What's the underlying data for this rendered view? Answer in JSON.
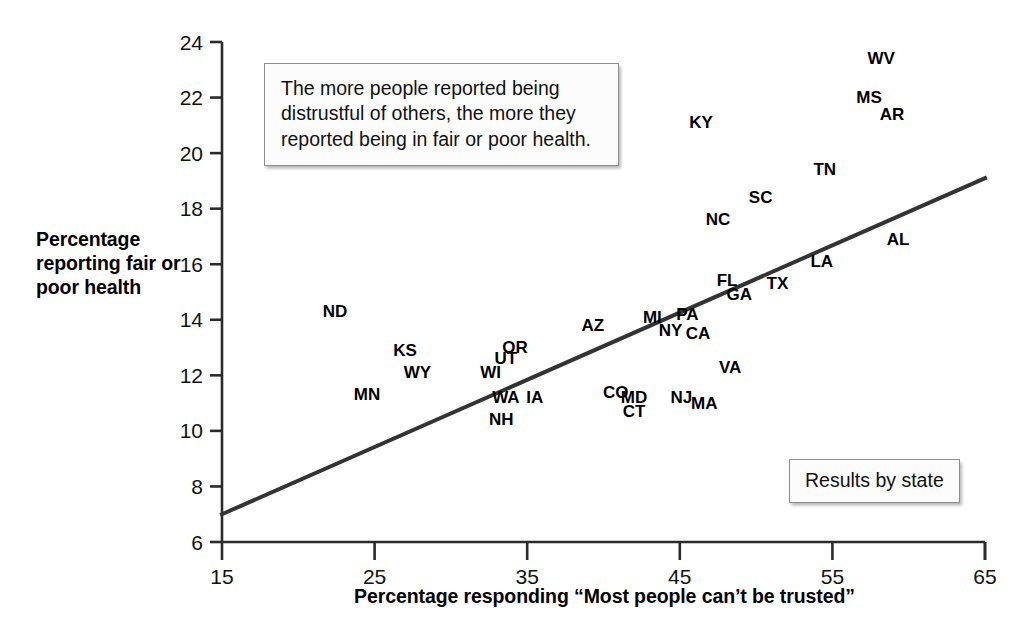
{
  "chart_data": {
    "type": "scatter",
    "title": "",
    "xlabel": "Percentage responding “Most people can’t be trusted”",
    "ylabel": "Percentage reporting fair or poor health",
    "xlim": [
      15,
      65
    ],
    "ylim": [
      6,
      24
    ],
    "xticks": [
      15,
      25,
      35,
      45,
      55,
      65
    ],
    "yticks": [
      6,
      8,
      10,
      12,
      14,
      16,
      18,
      20,
      22,
      24
    ],
    "grid": false,
    "legend_position": "bottom-right",
    "point_style": "text-label-only",
    "annotations": [
      {
        "name": "annotation-box",
        "text": "The more people reported being distrustful of others, the more they reported being in fair or poor health."
      },
      {
        "name": "legend-box",
        "text": "Results by state"
      }
    ],
    "trendline": {
      "name": "regression-line",
      "x": [
        15,
        65
      ],
      "y": [
        7.0,
        19.1
      ],
      "color": "#333333",
      "width": 4
    },
    "points": [
      {
        "label": "ND",
        "x": 22.4,
        "y": 14.1
      },
      {
        "label": "MN",
        "x": 24.5,
        "y": 11.1
      },
      {
        "label": "KS",
        "x": 27.0,
        "y": 12.7
      },
      {
        "label": "WY",
        "x": 27.8,
        "y": 11.9
      },
      {
        "label": "WI",
        "x": 32.6,
        "y": 11.9
      },
      {
        "label": "UT",
        "x": 33.6,
        "y": 12.4
      },
      {
        "label": "OR",
        "x": 34.2,
        "y": 12.8
      },
      {
        "label": "WA",
        "x": 33.6,
        "y": 11.0
      },
      {
        "label": "IA",
        "x": 35.5,
        "y": 11.0
      },
      {
        "label": "NH",
        "x": 33.3,
        "y": 10.2
      },
      {
        "label": "AZ",
        "x": 39.3,
        "y": 13.6
      },
      {
        "label": "CO",
        "x": 40.8,
        "y": 11.2
      },
      {
        "label": "MD",
        "x": 42.0,
        "y": 11.0
      },
      {
        "label": "CT",
        "x": 42.0,
        "y": 10.5
      },
      {
        "label": "MI",
        "x": 43.2,
        "y": 13.9
      },
      {
        "label": "NY",
        "x": 44.4,
        "y": 13.4
      },
      {
        "label": "PA",
        "x": 45.5,
        "y": 14.0
      },
      {
        "label": "CA",
        "x": 46.2,
        "y": 13.3
      },
      {
        "label": "NJ",
        "x": 45.1,
        "y": 11.0
      },
      {
        "label": "MA",
        "x": 46.6,
        "y": 10.8
      },
      {
        "label": "VA",
        "x": 48.3,
        "y": 12.1
      },
      {
        "label": "FL",
        "x": 48.1,
        "y": 15.2
      },
      {
        "label": "GA",
        "x": 48.9,
        "y": 14.7
      },
      {
        "label": "TX",
        "x": 51.4,
        "y": 15.1
      },
      {
        "label": "NC",
        "x": 47.5,
        "y": 17.4
      },
      {
        "label": "SC",
        "x": 50.3,
        "y": 18.2
      },
      {
        "label": "KY",
        "x": 46.4,
        "y": 20.9
      },
      {
        "label": "TN",
        "x": 54.5,
        "y": 19.2
      },
      {
        "label": "LA",
        "x": 54.3,
        "y": 15.9
      },
      {
        "label": "AL",
        "x": 59.3,
        "y": 16.7
      },
      {
        "label": "MS",
        "x": 57.4,
        "y": 21.8
      },
      {
        "label": "AR",
        "x": 58.9,
        "y": 21.2
      },
      {
        "label": "WV",
        "x": 58.2,
        "y": 23.2
      }
    ]
  },
  "axes": {
    "y_title": "Percentage reporting fair or poor health",
    "x_title": "Percentage responding “Most people can’t be trusted”"
  },
  "boxes": {
    "annotation": "The more people reported being distrustful of others, the more they reported being in fair or poor health.",
    "legend": "Results by state"
  },
  "colors": {
    "background": "#ffffff",
    "axis": "#2b2b2b",
    "text": "#000000",
    "trendline": "#333333",
    "box_fill": "#fcfcfc",
    "box_border": "#8d8d8d"
  }
}
